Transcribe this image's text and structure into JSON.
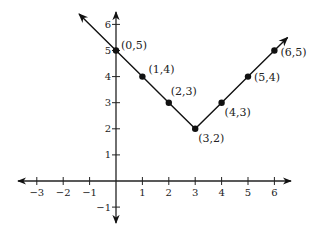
{
  "chart_data": {
    "type": "line",
    "title": "",
    "xlabel": "",
    "ylabel": "",
    "xlim": [
      -3,
      6
    ],
    "ylim": [
      -1,
      6
    ],
    "grid": false,
    "x_ticks": [
      -3,
      -2,
      -1,
      1,
      2,
      3,
      4,
      5,
      6
    ],
    "y_ticks": [
      -1,
      1,
      2,
      3,
      4,
      5,
      6
    ],
    "x_tick_labels": [
      "−3",
      "−2",
      "−1",
      "1",
      "2",
      "3",
      "4",
      "5",
      "6"
    ],
    "y_tick_labels": [
      "−1",
      "1",
      "2",
      "3",
      "4",
      "5",
      "6"
    ],
    "series": [
      {
        "name": "y = |x - 3| + 2",
        "x": [
          0,
          1,
          2,
          3,
          4,
          5,
          6
        ],
        "y": [
          5,
          4,
          3,
          2,
          3,
          4,
          5
        ],
        "point_labels": [
          "(0,5)",
          "(1,4)",
          "(2,3)",
          "(3,2)",
          "(4,3)",
          "(5,4)",
          "(6,5)"
        ],
        "arrows_at_ends": true
      }
    ],
    "colors": {
      "line": "#111111",
      "axis": "#222222"
    }
  }
}
